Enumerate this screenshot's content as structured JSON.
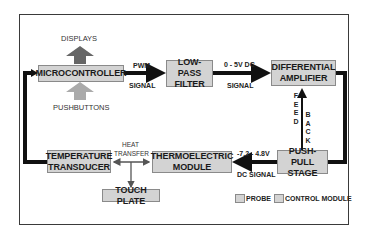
{
  "diagram": {
    "type": "block-diagram",
    "colors": {
      "box_fill": "#d3d3d3",
      "box_border": "#8a8a8a",
      "thick_wire": "#111111",
      "thin_wire": "#555555",
      "displays_arrow": "#666666",
      "pushbuttons_arrow": "#aaaaaa"
    },
    "blocks": {
      "microcontroller": "MICROCONTROLLER",
      "low_pass_filter": "LOW-PASS\nFILTER",
      "differential_amplifier": "DIFFERENTIAL\nAMPLIFIER",
      "push_pull_stage": "PUSH-PULL\nSTAGE",
      "thermoelectric_module": "THERMOELECTRIC\nMODULE",
      "temperature_transducer": "TEMPERATURE\nTRANSDUCER",
      "touch_plate": "TOUCH PLATE"
    },
    "io": {
      "displays": "DISPLAYS",
      "pushbuttons": "PUSHBUTTONS"
    },
    "signals": {
      "pwm_top": "PWM",
      "pwm_bottom": "SIGNAL",
      "dc_top": "0 - 5V DC",
      "dc_bottom": "SIGNAL",
      "feedback_left": "F\nE\nE\nD",
      "feedback_right": "B\nA\nC\nK",
      "drive_top": "-7.2 - 4.8V",
      "drive_bottom": "DC SIGNAL",
      "heat_top": "HEAT",
      "heat_bottom": "TRANSFER"
    },
    "legend": [
      {
        "label": "PROBE"
      },
      {
        "label": "CONTROL MODULE"
      }
    ]
  }
}
